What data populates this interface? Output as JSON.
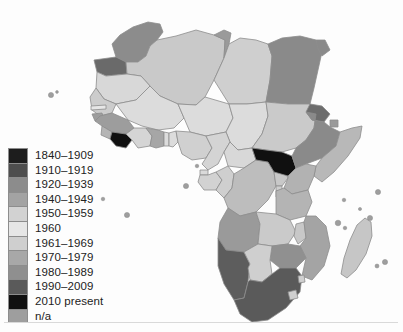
{
  "figure": {
    "background_color": "#fdfdfd",
    "ocean_color": "#ffffff",
    "border_color": "#8d8d8d"
  },
  "legend": {
    "name": "map-legend",
    "items": [
      {
        "label": "1840–1909",
        "color": "#1d1d1d"
      },
      {
        "label": "1910–1919",
        "color": "#4e4e4e"
      },
      {
        "label": "1920–1939",
        "color": "#8c8c8c"
      },
      {
        "label": "1940–1949",
        "color": "#a3a3a3"
      },
      {
        "label": "1950–1959",
        "color": "#d2d2d2"
      },
      {
        "label": "1960",
        "color": "#e6e6e6"
      },
      {
        "label": "1961–1969",
        "color": "#cfcfcf"
      },
      {
        "label": "1970–1979",
        "color": "#a8a8a8"
      },
      {
        "label": "1980–1989",
        "color": "#8f8f8f"
      },
      {
        "label": "1990–2009",
        "color": "#5a5a5a"
      },
      {
        "label": "2010 present",
        "color": "#101010"
      },
      {
        "label": "n/a",
        "color": "#9e9e9e"
      }
    ]
  },
  "map_regions": [
    {
      "name": "morocco",
      "color": "#8c8c8c"
    },
    {
      "name": "western-sahara",
      "color": "#6a6a6a"
    },
    {
      "name": "algeria",
      "color": "#c9c9c9"
    },
    {
      "name": "tunisia",
      "color": "#9a9a9a"
    },
    {
      "name": "libya",
      "color": "#cfcfcf"
    },
    {
      "name": "egypt",
      "color": "#8a8a8a"
    },
    {
      "name": "mauritania",
      "color": "#d8d8d8"
    },
    {
      "name": "mali",
      "color": "#dcdcdc"
    },
    {
      "name": "niger",
      "color": "#dcdcdc"
    },
    {
      "name": "chad",
      "color": "#dcdcdc"
    },
    {
      "name": "sudan",
      "color": "#cacaca"
    },
    {
      "name": "south-sudan",
      "color": "#101010"
    },
    {
      "name": "ethiopia",
      "color": "#8a8a8a"
    },
    {
      "name": "eritrea",
      "color": "#6d6d6d"
    },
    {
      "name": "djibouti",
      "color": "#9a9a9a"
    },
    {
      "name": "somalia",
      "color": "#b8b8b8"
    },
    {
      "name": "kenya",
      "color": "#b2b2b2"
    },
    {
      "name": "uganda",
      "color": "#c8c8c8"
    },
    {
      "name": "tanzania",
      "color": "#b4b4b4"
    },
    {
      "name": "senegal",
      "color": "#cccccc"
    },
    {
      "name": "guinea",
      "color": "#9d9d9d"
    },
    {
      "name": "sierra-leone",
      "color": "#b5b5b5"
    },
    {
      "name": "liberia",
      "color": "#101010"
    },
    {
      "name": "ivory-coast",
      "color": "#d5d5d5"
    },
    {
      "name": "ghana",
      "color": "#a6a6a6"
    },
    {
      "name": "nigeria",
      "color": "#d0d0d0"
    },
    {
      "name": "cameroon",
      "color": "#d4d4d4"
    },
    {
      "name": "car",
      "color": "#d8d8d8"
    },
    {
      "name": "gabon",
      "color": "#d2d2d2"
    },
    {
      "name": "dr-congo",
      "color": "#bdbdbd"
    },
    {
      "name": "angola",
      "color": "#9a9a9a"
    },
    {
      "name": "zambia",
      "color": "#cacaca"
    },
    {
      "name": "zimbabwe",
      "color": "#909090"
    },
    {
      "name": "mozambique",
      "color": "#a4a4a4"
    },
    {
      "name": "namibia",
      "color": "#5d5d5d"
    },
    {
      "name": "botswana",
      "color": "#cfcfcf"
    },
    {
      "name": "south-africa",
      "color": "#5a5a5a"
    },
    {
      "name": "lesotho",
      "color": "#cfcfcf"
    },
    {
      "name": "madagascar",
      "color": "#c6c6c6"
    }
  ]
}
